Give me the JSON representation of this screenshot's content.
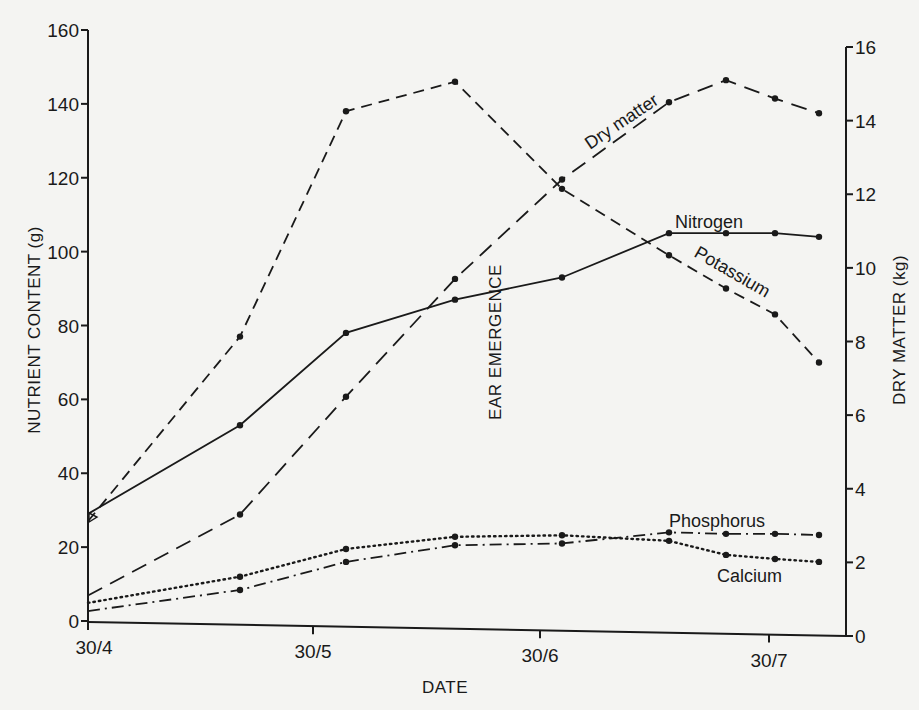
{
  "chart_data": {
    "type": "line",
    "title": "",
    "xlabel": "DATE",
    "ylabel": "NUTRIENT CONTENT (g)",
    "y2label": "DRY MATTER (kg)",
    "annotation": "EAR EMERGENCE",
    "x_ticks": [
      "30/4",
      "30/5",
      "30/6",
      "30/7"
    ],
    "y_ticks": [
      0,
      20,
      40,
      60,
      80,
      100,
      120,
      140,
      160
    ],
    "y2_ticks": [
      0,
      2,
      4,
      6,
      8,
      10,
      12,
      14,
      16
    ],
    "ylim": [
      0,
      160
    ],
    "y2lim": [
      0,
      16
    ],
    "grid": false,
    "x": [
      "30/4",
      "20/5",
      "4/6",
      "19/6",
      "3/7",
      "16/7",
      "25/7",
      "31/7",
      "6/8"
    ],
    "series": [
      {
        "name": "Dry matter",
        "axis": "right",
        "unit": "kg",
        "style": "long-dash",
        "values": [
          1.1,
          3.3,
          6.5,
          9.7,
          12.4,
          14.5,
          15.1,
          14.6,
          14.2
        ]
      },
      {
        "name": "Nitrogen",
        "axis": "left",
        "unit": "g",
        "style": "solid",
        "values": [
          29,
          53,
          78,
          87,
          93,
          105,
          105,
          105,
          104
        ]
      },
      {
        "name": "Potassium",
        "axis": "left",
        "unit": "g",
        "style": "short-dash",
        "values": [
          27,
          77,
          138,
          146,
          117,
          99,
          90,
          83,
          70
        ]
      },
      {
        "name": "Phosphorus",
        "axis": "left",
        "unit": "g",
        "style": "dash-dot",
        "values": [
          2.7,
          8.4,
          16,
          20.5,
          21,
          24,
          23.6,
          23.6,
          23.3
        ]
      },
      {
        "name": "Calcium",
        "axis": "left",
        "unit": "g",
        "style": "dotted",
        "values": [
          4.9,
          12,
          19.5,
          22.8,
          23.2,
          21.7,
          17.9,
          16.8,
          16
        ]
      }
    ]
  },
  "labels": {
    "y_left_title": "NUTRIENT CONTENT (g)",
    "y_right_title": "DRY MATTER (kg)",
    "x_title": "DATE",
    "ear_emergence": "EAR EMERGENCE",
    "dry_matter": "Dry matter",
    "nitrogen": "Nitrogen",
    "potassium": "Potassium",
    "phosphorus": "Phosphorus",
    "calcium": "Calcium"
  }
}
